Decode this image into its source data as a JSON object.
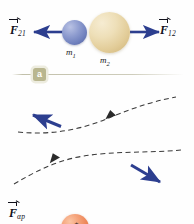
{
  "figure": {
    "colors": {
      "arrow_blue": "#2c3e8f",
      "sphere_blue": "#6f80bd",
      "sphere_tan": "#e2cc98",
      "sphere_orange": "#ec8152",
      "sphere_gold": "#d9c983",
      "badge_olive": "#b9b68f",
      "dashed_gray": "#3a3a3a",
      "rule_gray": "#bebca5",
      "text_black": "#10101a",
      "background": "#fefefe"
    }
  },
  "panel_a": {
    "badge": "a",
    "bodies": [
      {
        "id": "m1",
        "label": "m",
        "subscript": "1",
        "color": "#6f80bd",
        "radius_px": 12.5
      },
      {
        "id": "m2",
        "label": "m",
        "subscript": "2",
        "color": "#e2cc98",
        "radius_px": 20.5
      }
    ],
    "forces": [
      {
        "id": "F21",
        "symbol": "F",
        "subscript": "21",
        "direction": "left",
        "acts_on": "m1",
        "color": "#2c3e8f"
      },
      {
        "id": "F12",
        "symbol": "F",
        "subscript": "12",
        "direction": "right",
        "acts_on": "m2",
        "color": "#2c3e8f"
      }
    ]
  },
  "panel_b": {
    "badge": "b",
    "bodies": [
      {
        "id": "proton",
        "label": "p",
        "charge": "+",
        "color": "#ec8152",
        "radius_px": 14
      },
      {
        "id": "helium",
        "label": "He",
        "mass_number": "4",
        "charge": "++",
        "color": "#d9c983",
        "radius_px": 16
      }
    ],
    "forces": [
      {
        "id": "Fap",
        "symbol": "F",
        "subscript": "αp",
        "direction": "up-left",
        "acts_on": "proton",
        "color": "#2c3e8f"
      },
      {
        "id": "Fpa",
        "symbol": "F",
        "subscript": "pα",
        "direction": "down-right",
        "acts_on": "helium",
        "color": "#2c3e8f"
      }
    ],
    "trajectories": [
      {
        "id": "proton-path",
        "style": "dashed",
        "arrow_direction": "left"
      },
      {
        "id": "helium-path",
        "style": "dashed",
        "arrow_direction": "left"
      }
    ]
  }
}
